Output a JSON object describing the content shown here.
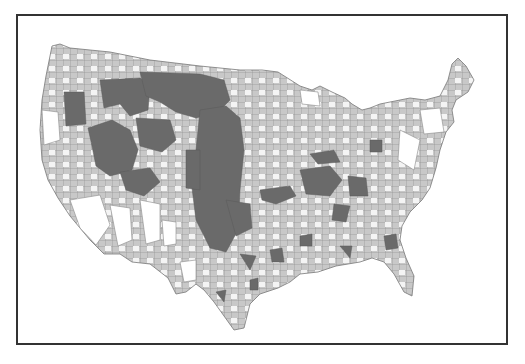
{
  "map": {
    "type": "choropleth",
    "region": "contiguous United States (counties)",
    "classes": [
      {
        "name": "class-1",
        "color": "#ffffff"
      },
      {
        "name": "class-2",
        "color": "#c8c8c8"
      },
      {
        "name": "class-3",
        "color": "#6a6a6a"
      }
    ],
    "border_color": "#8a8a8a",
    "frame_color": "#333333"
  }
}
